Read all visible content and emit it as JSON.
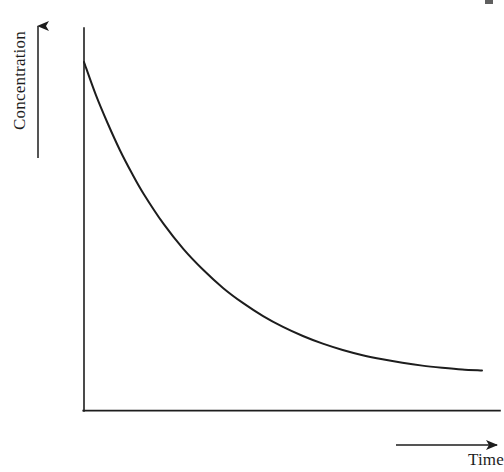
{
  "figure": {
    "kind": "line-plot",
    "background_color": "#ffffff",
    "ink_color": "#1d1d1d",
    "width": 504,
    "height": 472
  },
  "axes": {
    "y_axis": {
      "label": "Concentration",
      "label_orientation": "rotated-90-ccw",
      "arrow_direction": "up",
      "arrow_glyph": "arrow-up",
      "line_x": 84,
      "line_top_y": 28,
      "line_bottom_y": 411
    },
    "x_axis": {
      "label": "Time",
      "label_orientation": "horizontal",
      "arrow_direction": "right",
      "arrow_glyph": "arrow-right",
      "line_y": 411,
      "line_left_x": 84,
      "line_right_x": 500
    }
  },
  "chart_data": {
    "type": "line",
    "title": "",
    "subtitle": "",
    "xlabel": "Time",
    "ylabel": "Concentration",
    "grid": false,
    "legend": false,
    "legend_position": "none",
    "axis_ticks": false,
    "tick_labels": [],
    "annotations": [],
    "xlim": [
      0,
      1
    ],
    "ylim": [
      0,
      1
    ],
    "series": [
      {
        "name": "Concentration",
        "color": "#1d1d1d",
        "line_width": 2,
        "x": [
          0.0,
          0.03,
          0.06,
          0.09,
          0.12,
          0.15,
          0.2,
          0.25,
          0.3,
          0.35,
          0.4,
          0.45,
          0.5,
          0.55,
          0.6,
          0.65,
          0.7,
          0.75,
          0.8,
          0.85,
          0.9,
          0.95,
          1.0
        ],
        "y": [
          1.0,
          0.905,
          0.823,
          0.748,
          0.682,
          0.622,
          0.536,
          0.464,
          0.404,
          0.352,
          0.309,
          0.272,
          0.241,
          0.215,
          0.193,
          0.175,
          0.16,
          0.148,
          0.138,
          0.13,
          0.124,
          0.119,
          0.116
        ]
      }
    ]
  },
  "artifacts": {
    "scan_speck": {
      "name": "scan-speck",
      "x": 485,
      "y": 0,
      "width": 8,
      "height": 4
    }
  }
}
